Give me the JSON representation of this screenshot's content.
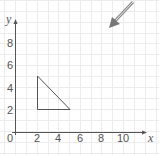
{
  "diagram": {
    "type": "coordinate-grid",
    "axes": {
      "x_label": "x",
      "y_label": "y",
      "origin_label": "0",
      "x_ticks": [
        "2",
        "4",
        "6",
        "8",
        "10"
      ],
      "y_ticks": [
        "2",
        "4",
        "6",
        "8"
      ],
      "x_range": [
        0,
        11
      ],
      "y_range": [
        0,
        9
      ]
    },
    "shape": {
      "name": "triangle",
      "vertices": [
        [
          2,
          5
        ],
        [
          2,
          2
        ],
        [
          5,
          2
        ]
      ]
    },
    "arrow": {
      "direction": "down-left",
      "color": "#777777"
    },
    "colors": {
      "grid": "#ececec",
      "axis": "#555555",
      "shape_stroke": "#555555"
    }
  }
}
